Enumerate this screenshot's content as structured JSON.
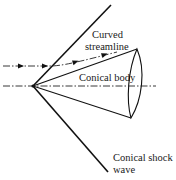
{
  "diagram": {
    "type": "conical-shock-schematic",
    "labels": {
      "streamline_line1": "Curved",
      "streamline_line2": "streamline",
      "body": "Conical body",
      "shock_line1": "Conical shock",
      "shock_line2": "wave"
    },
    "colors": {
      "line": "#111111",
      "text": "#1a1a1a",
      "background": "#ffffff"
    }
  }
}
